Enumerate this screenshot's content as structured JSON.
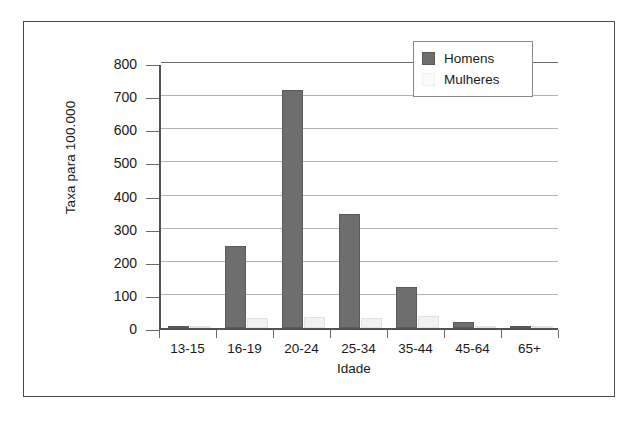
{
  "chart_data": {
    "type": "bar",
    "title": "",
    "xlabel": "Idade",
    "ylabel": "Taxa para 100.000",
    "categories": [
      "13-15",
      "16-19",
      "20-24",
      "25-34",
      "35-44",
      "45-64",
      "65+"
    ],
    "series": [
      {
        "name": "Homens",
        "color": "#6e6e6e",
        "values": [
          4,
          249,
          718,
          343,
          123,
          18,
          3
        ]
      },
      {
        "name": "Mulheres",
        "color": "#f2f2f0",
        "values": [
          2,
          30,
          33,
          30,
          36,
          5,
          1
        ]
      }
    ],
    "ylim": [
      0,
      800
    ],
    "yticks": [
      0,
      100,
      200,
      300,
      400,
      500,
      600,
      700,
      800
    ],
    "ytick_labels": [
      "0",
      "100",
      "200",
      "300",
      "400",
      "500",
      "600",
      "700",
      "800"
    ],
    "grid": true,
    "legend_position": "top-right",
    "legend_entries": [
      "Homens",
      "Mulheres"
    ]
  }
}
